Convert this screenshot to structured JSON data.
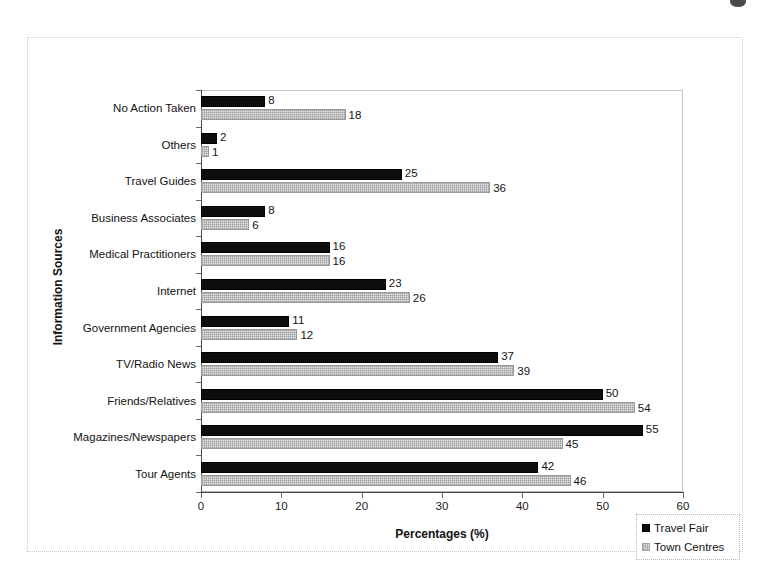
{
  "chart_data": {
    "type": "bar",
    "orientation": "horizontal",
    "title": "",
    "xlabel": "Percentages (%)",
    "ylabel": "Information Sources",
    "xlim": [
      0,
      60
    ],
    "xticks": [
      0,
      10,
      20,
      30,
      40,
      50,
      60
    ],
    "grid": false,
    "legend_position": "bottom-right",
    "categories": [
      "No Action Taken",
      "Others",
      "Travel Guides",
      "Business Associates",
      "Medical Practitioners",
      "Internet",
      "Government Agencies",
      "TV/Radio News",
      "Friends/Relatives",
      "Magazines/Newspapers",
      "Tour Agents"
    ],
    "series": [
      {
        "name": "Travel Fair",
        "color": "#0d0d0d",
        "values": [
          8,
          2,
          25,
          8,
          16,
          23,
          11,
          37,
          50,
          55,
          42
        ]
      },
      {
        "name": "Town Centres",
        "color": "#e6e6e6",
        "values": [
          18,
          1,
          36,
          6,
          16,
          26,
          12,
          39,
          54,
          45,
          46
        ]
      }
    ]
  },
  "legend": {
    "items": [
      {
        "label": "Travel Fair",
        "swatch": "travel"
      },
      {
        "label": "Town Centres",
        "swatch": "town"
      }
    ]
  }
}
